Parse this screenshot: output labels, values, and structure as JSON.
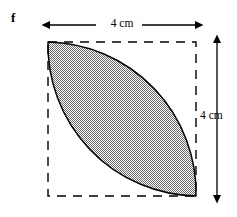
{
  "figure": {
    "part_letter": "f",
    "top_dimension_label": "4 cm",
    "right_dimension_label": "4 cm",
    "shape_name": "shaded-lens-in-square",
    "colors": {
      "outline": "#000000",
      "fill_gray": "#9a9a9a",
      "dashed_guide": "#000000",
      "background": "#ffffff"
    },
    "square": {
      "left": 48,
      "top": 42,
      "right": 196,
      "bottom": 196,
      "side_label": "4 cm",
      "border_style": "dashed"
    },
    "top_arrow": {
      "x_start": 50,
      "x_end": 196,
      "y": 25,
      "heads": "both"
    },
    "right_arrow": {
      "x": 217,
      "y_start": 42,
      "y_end": 196,
      "heads": "both"
    }
  }
}
